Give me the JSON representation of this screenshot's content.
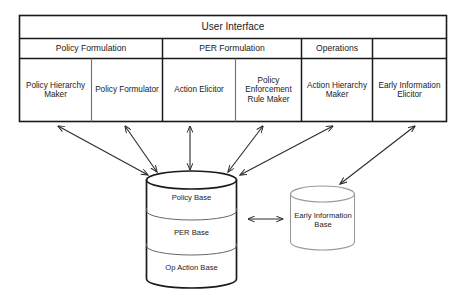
{
  "diagram": {
    "table": {
      "header": {
        "label": "User Interface"
      },
      "groups": [
        {
          "label": "Policy Formulation"
        },
        {
          "label": "PER Formulation"
        },
        {
          "label": "Operations"
        },
        {
          "label": ""
        }
      ],
      "components": [
        {
          "label": "Policy Hierarchy Maker"
        },
        {
          "label": "Policy Formulator"
        },
        {
          "label": "Action Elicitor"
        },
        {
          "label": "Policy Enforcement Rule Maker"
        },
        {
          "label": "Action Hierarchy Maker"
        },
        {
          "label": "Early Information Elicitor"
        }
      ]
    },
    "stores": {
      "main_cylinder": {
        "name": "knowledge-base-cylinder",
        "bands": [
          {
            "label": "Policy Base"
          },
          {
            "label": "PER Base"
          },
          {
            "label": "Op Action Base"
          }
        ]
      },
      "side_cylinder": {
        "name": "early-information-base-cylinder",
        "label": "Early Information Base"
      }
    },
    "connectors": [
      {
        "name": "policy-hierarchy-maker-to-knowledge-base",
        "type": "double-arrow"
      },
      {
        "name": "policy-formulator-to-knowledge-base",
        "type": "double-arrow"
      },
      {
        "name": "action-elicitor-to-knowledge-base",
        "type": "double-arrow"
      },
      {
        "name": "per-rule-maker-to-knowledge-base",
        "type": "double-arrow"
      },
      {
        "name": "action-hierarchy-maker-to-knowledge-base",
        "type": "double-arrow"
      },
      {
        "name": "early-information-elicitor-to-early-information-base",
        "type": "double-arrow"
      },
      {
        "name": "knowledge-base-to-early-information-base",
        "type": "double-arrow"
      }
    ],
    "colors": {
      "stroke_strong": "#1a1a1a",
      "stroke_light": "#9a9a9a",
      "stroke_arrow": "#2b2b2b",
      "background": "#ffffff"
    }
  }
}
